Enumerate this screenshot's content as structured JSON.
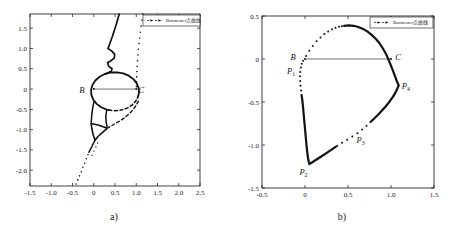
{
  "figure": {
    "type": "two-panel scatter figure",
    "background": "#ffffff",
    "ink_color": "#111111"
  },
  "chart_data": [
    {
      "id": "a",
      "type": "scatter",
      "caption": "a)",
      "title": "",
      "xlabel": "",
      "ylabel": "",
      "grid": false,
      "xlim": [
        -1.5,
        2.5
      ],
      "ylim": [
        -2.39,
        1.85
      ],
      "xtick_values": [
        -1.5,
        -1.0,
        -0.5,
        0,
        0.5,
        1.0,
        1.5,
        2.0,
        2.5
      ],
      "xtick_labels": [
        "-1.5",
        "-1.0",
        "-0.5",
        "0",
        "0.5",
        "1.0",
        "1.5",
        "2.0",
        "2.5"
      ],
      "ytick_values": [
        1.5,
        1.0,
        0.5,
        0,
        -0.5,
        -1.0,
        -1.5,
        -2.0
      ],
      "ytick_labels": [
        "1.5",
        "1.0",
        "0.5",
        "0",
        "-0.5",
        "-1.0",
        "-1.5",
        "-2.0"
      ],
      "legend": {
        "label": "Burmester点曲线",
        "position": "top-right",
        "marker": "dash-dot"
      },
      "baseline": {
        "x1": 0,
        "y1": 0,
        "x2": 1,
        "y2": 0
      },
      "annotations": [
        {
          "base": "B",
          "sub": "",
          "x": -0.34,
          "y": -0.1
        },
        {
          "base": "C",
          "sub": "",
          "x": 1.05,
          "y": -0.1
        }
      ],
      "series": [
        {
          "name": "oval-solid",
          "style": "solid",
          "width": 1.8,
          "points": [
            [
              1.031,
              -0.222
            ],
            [
              1.063,
              -0.101
            ],
            [
              1.056,
              0.022
            ],
            [
              1.012,
              0.141
            ],
            [
              0.933,
              0.245
            ],
            [
              0.824,
              0.329
            ],
            [
              0.693,
              0.386
            ],
            [
              0.549,
              0.413
            ],
            [
              0.402,
              0.408
            ],
            [
              0.261,
              0.37
            ],
            [
              0.137,
              0.304
            ],
            [
              0.037,
              0.212
            ],
            [
              -0.031,
              0.102
            ],
            [
              -0.063,
              -0.019
            ],
            [
              -0.056,
              -0.142
            ],
            [
              -0.012,
              -0.261
            ],
            [
              0.067,
              -0.365
            ],
            [
              0.176,
              -0.449
            ],
            [
              0.307,
              -0.506
            ],
            [
              0.354,
              -0.519
            ]
          ]
        },
        {
          "name": "oval-dashed",
          "style": "dash",
          "width": 1.5,
          "points": [
            [
              0.354,
              -0.519
            ],
            [
              0.5,
              -0.535
            ],
            [
              0.646,
              -0.519
            ],
            [
              0.783,
              -0.471
            ],
            [
              0.9,
              -0.396
            ],
            [
              0.989,
              -0.298
            ],
            [
              1.031,
              -0.222
            ]
          ]
        },
        {
          "name": "upper-squiggle",
          "style": "solid",
          "width": 1.7,
          "points": [
            [
              0.6,
              1.85
            ],
            [
              0.52,
              1.56
            ],
            [
              0.44,
              1.3
            ],
            [
              0.37,
              1.1
            ],
            [
              0.335,
              1.0
            ],
            [
              0.42,
              0.94
            ],
            [
              0.49,
              0.86
            ],
            [
              0.485,
              0.77
            ],
            [
              0.41,
              0.7
            ],
            [
              0.325,
              0.655
            ],
            [
              0.35,
              0.565
            ],
            [
              0.43,
              0.5
            ],
            [
              0.41,
              0.435
            ],
            [
              0.32,
              0.395
            ],
            [
              0.261,
              0.37
            ]
          ]
        },
        {
          "name": "left-descender",
          "style": "solid",
          "width": 1.5,
          "points": [
            [
              0.0,
              -0.32
            ],
            [
              -0.03,
              -0.5
            ],
            [
              -0.05,
              -0.68
            ],
            [
              -0.06,
              -0.85
            ]
          ]
        },
        {
          "name": "right-descender",
          "style": "solid",
          "width": 1.5,
          "points": [
            [
              0.307,
              -0.506
            ],
            [
              0.285,
              -0.66
            ],
            [
              0.29,
              -0.8
            ],
            [
              0.315,
              -0.94
            ]
          ]
        },
        {
          "name": "knot-triangle",
          "style": "solid",
          "width": 1.6,
          "points": [
            [
              -0.06,
              -0.85
            ],
            [
              0.1,
              -0.885
            ],
            [
              0.24,
              -0.935
            ],
            [
              0.32,
              -0.965
            ],
            [
              0.215,
              -1.06
            ],
            [
              0.1,
              -1.17
            ],
            [
              0.03,
              -1.26
            ],
            [
              -0.015,
              -1.12
            ],
            [
              -0.045,
              -0.985
            ],
            [
              -0.06,
              -0.85
            ]
          ]
        },
        {
          "name": "knot-tail-solid",
          "style": "solid",
          "width": 1.4,
          "points": [
            [
              0.03,
              -1.26
            ],
            [
              -0.045,
              -1.42
            ],
            [
              -0.115,
              -1.56
            ]
          ]
        },
        {
          "name": "lower-dashed-branch",
          "style": "dash",
          "width": 1.4,
          "points": [
            [
              1.05,
              -0.3
            ],
            [
              0.99,
              -0.415
            ],
            [
              0.915,
              -0.525
            ],
            [
              0.82,
              -0.625
            ],
            [
              0.715,
              -0.715
            ],
            [
              0.61,
              -0.79
            ],
            [
              0.5,
              -0.855
            ],
            [
              0.41,
              -0.91
            ],
            [
              0.345,
              -0.95
            ]
          ]
        },
        {
          "name": "asymptote-dots-top",
          "style": "dots",
          "r": 0.8,
          "points": [
            [
              1.155,
              1.85
            ],
            [
              1.135,
              1.7
            ],
            [
              1.115,
              1.55
            ],
            [
              1.095,
              1.4
            ],
            [
              1.08,
              1.26
            ],
            [
              1.065,
              1.12
            ],
            [
              1.05,
              0.98
            ],
            [
              1.04,
              0.84
            ],
            [
              1.03,
              0.7
            ],
            [
              1.022,
              0.56
            ],
            [
              1.015,
              0.43
            ],
            [
              1.01,
              0.3
            ],
            [
              1.006,
              0.18
            ],
            [
              1.003,
              0.06
            ]
          ]
        },
        {
          "name": "asymptote-dots-bottom",
          "style": "dots",
          "r": 0.8,
          "points": [
            [
              -0.135,
              -1.62
            ],
            [
              -0.175,
              -1.72
            ],
            [
              -0.215,
              -1.83
            ],
            [
              -0.255,
              -1.93
            ],
            [
              -0.295,
              -2.04
            ],
            [
              -0.335,
              -2.14
            ],
            [
              -0.375,
              -2.24
            ],
            [
              -0.415,
              -2.34
            ]
          ]
        },
        {
          "name": "knot-dots-inner",
          "style": "dots",
          "r": 0.7,
          "points": [
            [
              0.09,
              -1.33
            ],
            [
              0.05,
              -1.43
            ],
            [
              0.005,
              -1.53
            ],
            [
              -0.04,
              -1.63
            ]
          ]
        }
      ]
    },
    {
      "id": "b",
      "type": "scatter",
      "caption": "b)",
      "title": "",
      "xlabel": "",
      "ylabel": "",
      "grid": false,
      "xlim": [
        -0.5,
        1.5
      ],
      "ylim": [
        -1.5,
        0.5
      ],
      "xtick_values": [
        -0.5,
        0,
        0.5,
        1.0,
        1.5
      ],
      "xtick_labels": [
        "-0.5",
        "0",
        "0.5",
        "1.0",
        "1.5"
      ],
      "ytick_values": [
        0.5,
        0,
        -0.5,
        -1.0,
        -1.5
      ],
      "ytick_labels": [
        "0.5",
        "0",
        "-0.5",
        "-1.0",
        "-1.5"
      ],
      "legend": {
        "label": "Burmester点曲线",
        "position": "top-right",
        "marker": "dash-dot"
      },
      "baseline": {
        "x1": 0,
        "y1": 0,
        "x2": 1,
        "y2": 0
      },
      "annotations": [
        {
          "base": "B",
          "sub": "",
          "x": -0.17,
          "y": -0.015
        },
        {
          "base": "C",
          "sub": "",
          "x": 1.05,
          "y": -0.015
        },
        {
          "base": "P",
          "sub": "1",
          "x": -0.21,
          "y": -0.175
        },
        {
          "base": "P",
          "sub": "2",
          "x": -0.065,
          "y": -1.345
        },
        {
          "base": "P",
          "sub": "3",
          "x": 0.6,
          "y": -0.975
        },
        {
          "base": "P",
          "sub": "4",
          "x": 1.125,
          "y": -0.345
        }
      ],
      "series": [
        {
          "name": "arc-topleft-dots",
          "style": "dots",
          "r": 1.0,
          "points": [
            [
              0.012,
              0.035
            ],
            [
              0.05,
              0.095
            ],
            [
              0.09,
              0.15
            ],
            [
              0.135,
              0.205
            ],
            [
              0.18,
              0.25
            ],
            [
              0.225,
              0.29
            ],
            [
              0.27,
              0.32
            ],
            [
              0.315,
              0.345
            ],
            [
              0.355,
              0.362
            ],
            [
              0.395,
              0.374
            ],
            [
              0.43,
              0.381
            ]
          ]
        },
        {
          "name": "arc-main-solid",
          "style": "solid",
          "width": 2.2,
          "points": [
            [
              0.455,
              0.386
            ],
            [
              0.51,
              0.39
            ],
            [
              0.565,
              0.386
            ],
            [
              0.62,
              0.372
            ],
            [
              0.675,
              0.35
            ],
            [
              0.728,
              0.318
            ],
            [
              0.778,
              0.278
            ],
            [
              0.825,
              0.232
            ],
            [
              0.868,
              0.18
            ],
            [
              0.906,
              0.122
            ],
            [
              0.94,
              0.062
            ],
            [
              0.968,
              0.0
            ],
            [
              0.995,
              -0.065
            ],
            [
              1.02,
              -0.13
            ],
            [
              1.045,
              -0.195
            ],
            [
              1.065,
              -0.25
            ],
            [
              1.082,
              -0.29
            ],
            [
              1.09,
              -0.305
            ],
            [
              1.078,
              -0.335
            ],
            [
              1.055,
              -0.385
            ],
            [
              1.022,
              -0.44
            ],
            [
              0.982,
              -0.497
            ],
            [
              0.94,
              -0.55
            ],
            [
              0.895,
              -0.6
            ],
            [
              0.85,
              -0.648
            ],
            [
              0.805,
              -0.692
            ],
            [
              0.762,
              -0.732
            ]
          ]
        },
        {
          "name": "arc-right-dots",
          "style": "dots",
          "r": 1.0,
          "points": [
            [
              0.715,
              -0.775
            ],
            [
              0.665,
              -0.82
            ],
            [
              0.61,
              -0.862
            ],
            [
              0.55,
              -0.9
            ],
            [
              0.49,
              -0.94
            ],
            [
              0.43,
              -0.975
            ],
            [
              0.375,
              -1.008
            ]
          ]
        },
        {
          "name": "arc-bottom-solid",
          "style": "solid",
          "width": 2.2,
          "points": [
            [
              0.36,
              -1.018
            ],
            [
              0.3,
              -1.06
            ],
            [
              0.24,
              -1.1
            ],
            [
              0.18,
              -1.14
            ],
            [
              0.125,
              -1.175
            ],
            [
              0.08,
              -1.203
            ],
            [
              0.05,
              -1.222
            ],
            [
              0.038,
              -1.17
            ],
            [
              0.028,
              -1.1
            ],
            [
              0.018,
              -1.01
            ],
            [
              0.008,
              -0.9
            ],
            [
              -0.002,
              -0.79
            ],
            [
              -0.012,
              -0.68
            ],
            [
              -0.022,
              -0.57
            ],
            [
              -0.032,
              -0.47
            ],
            [
              -0.04,
              -0.42
            ]
          ]
        },
        {
          "name": "arc-left-dots",
          "style": "dots",
          "r": 1.0,
          "points": [
            [
              -0.046,
              -0.365
            ],
            [
              -0.052,
              -0.31
            ],
            [
              -0.056,
              -0.255
            ],
            [
              -0.058,
              -0.2
            ],
            [
              -0.055,
              -0.15
            ],
            [
              -0.048,
              -0.1
            ],
            [
              -0.038,
              -0.055
            ],
            [
              -0.022,
              -0.02
            ]
          ]
        }
      ]
    }
  ]
}
